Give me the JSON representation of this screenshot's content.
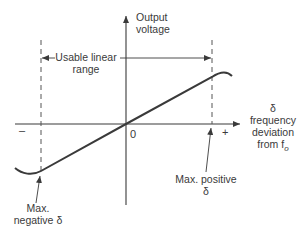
{
  "diagram": {
    "y_axis_label": [
      "Output",
      "voltage"
    ],
    "x_axis_label": [
      "δ",
      "frequency",
      "deviation",
      "from f"
    ],
    "x_axis_label_subscript": "o",
    "range_label": [
      "Usable linear",
      "range"
    ],
    "origin_label": "0",
    "minus_label": "–",
    "plus_label": "+",
    "max_negative_label": [
      "Max.",
      "negative δ"
    ],
    "max_positive_label": [
      "Max. positive",
      "δ"
    ]
  },
  "colors": {
    "line": "#3a3a3a",
    "background": "#ffffff"
  }
}
